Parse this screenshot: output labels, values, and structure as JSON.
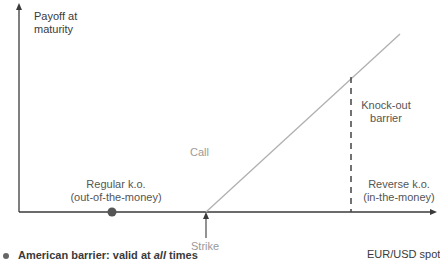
{
  "diagram": {
    "y_axis_label_line1": "Payoff at",
    "y_axis_label_line2": "maturity",
    "x_axis_label": "EUR/USD spot",
    "call_label": "Call",
    "strike_label": "Strike",
    "barrier_label_line1": "Knock-out",
    "barrier_label_line2": "barrier",
    "regular_ko_line1": "Regular k.o.",
    "regular_ko_line2": "(out-of-the-money)",
    "reverse_ko_line1": "Reverse k.o.",
    "reverse_ko_line2": "(in-the-money)",
    "footnote_prefix": "American barrier: valid at ",
    "footnote_emph": "all",
    "footnote_suffix": " times"
  },
  "colors": {
    "axis": "#3a3a3a",
    "payoff_line": "#b0b0b0",
    "barrier_dash": "#444444",
    "dot": "#555555",
    "grey_text": "#9a9a9a"
  }
}
